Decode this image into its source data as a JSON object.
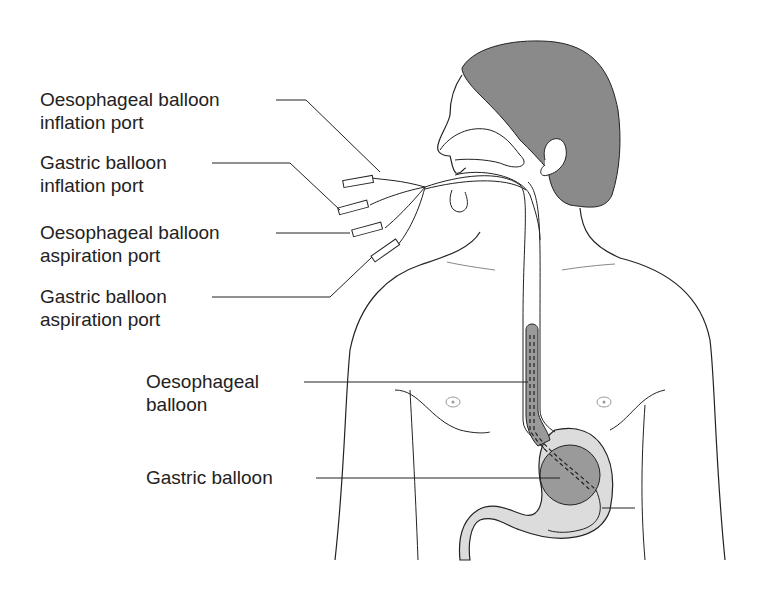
{
  "diagram": {
    "labels": [
      {
        "id": "oeso-inflation",
        "line1": "Oesophageal balloon",
        "line2": "inflation port"
      },
      {
        "id": "gastric-inflation",
        "line1": "Gastric balloon",
        "line2": "inflation port"
      },
      {
        "id": "oeso-aspiration",
        "line1": "Oesophageal balloon",
        "line2": "aspiration port"
      },
      {
        "id": "gastric-aspiration",
        "line1": "Gastric balloon",
        "line2": "aspiration port"
      },
      {
        "id": "oeso-balloon",
        "line1": "Oesophageal",
        "line2": "balloon"
      },
      {
        "id": "gastric-balloon",
        "line1": "Gastric balloon",
        "line2": ""
      }
    ],
    "colors": {
      "hair": "#8a8a8a",
      "balloon": "#9a9a9a",
      "stomach_fill": "#dcdcdc",
      "outline": "#222222",
      "nipple": "#999999"
    }
  }
}
